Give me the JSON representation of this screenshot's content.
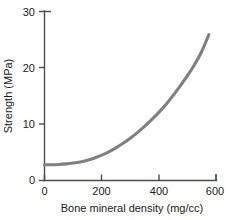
{
  "chart_data": {
    "type": "line",
    "title": "",
    "subtitle": "",
    "xlabel": "Bone mineral density (mg/cc)",
    "ylabel": "Strength (MPa)",
    "xlim": [
      0,
      600
    ],
    "ylim": [
      0,
      30
    ],
    "xticks": [
      0,
      200,
      400,
      600
    ],
    "xtick_labels": [
      "0",
      "200",
      "400",
      "600"
    ],
    "yticks": [
      0,
      10,
      20,
      30
    ],
    "ytick_labels": [
      "0",
      "10",
      "20",
      "30"
    ],
    "grid": false,
    "legend": null,
    "legend_position": "none",
    "series": [
      {
        "name": "Strength vs bone mineral density",
        "color": "#808080",
        "line_width": 3,
        "x": [
          0,
          25,
          50,
          75,
          100,
          125,
          150,
          175,
          200,
          225,
          250,
          275,
          300,
          325,
          350,
          375,
          400,
          425,
          450,
          475,
          500,
          525,
          550,
          575
        ],
        "y": [
          2.8,
          2.8,
          2.85,
          2.95,
          3.1,
          3.3,
          3.6,
          4.0,
          4.5,
          5.1,
          5.8,
          6.6,
          7.5,
          8.5,
          9.6,
          10.8,
          12.1,
          13.5,
          15.1,
          16.8,
          18.6,
          20.6,
          22.9,
          25.9
        ]
      }
    ],
    "annotations": []
  },
  "figure": {
    "background_color": "#ffffff",
    "axis_color": "#4d4d4d",
    "text_color": "#1a1a1a",
    "curve_color": "#808080"
  }
}
